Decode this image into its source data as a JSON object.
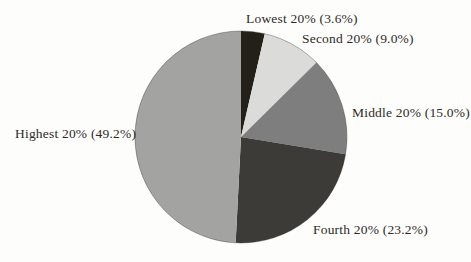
{
  "figure": {
    "background_color": "#fdfdfb",
    "text_color": "#2e2b27"
  },
  "chart_data": {
    "type": "pie",
    "title": "",
    "legend_position": "none",
    "label_style": "outside-callout-text",
    "direction": "clockwise",
    "start_angle": "12-oclock",
    "total": 100,
    "slices": [
      {
        "name": "Lowest 20%",
        "value": 3.6,
        "label": "Lowest 20% (3.6%)",
        "color": "#23201a"
      },
      {
        "name": "Second 20%",
        "value": 9.0,
        "label": "Second 20% (9.0%)",
        "color": "#dbdbd9"
      },
      {
        "name": "Middle 20%",
        "value": 15.0,
        "label": "Middle 20% (15.0%)",
        "color": "#7e7e7e"
      },
      {
        "name": "Fourth 20%",
        "value": 23.2,
        "label": "Fourth 20% (23.2%)",
        "color": "#3d3b37"
      },
      {
        "name": "Highest 20%",
        "value": 49.2,
        "label": "Highest 20% (49.2%)",
        "color": "#a3a3a1"
      }
    ],
    "outline_color": "rgba(40,40,38,0.35)"
  }
}
